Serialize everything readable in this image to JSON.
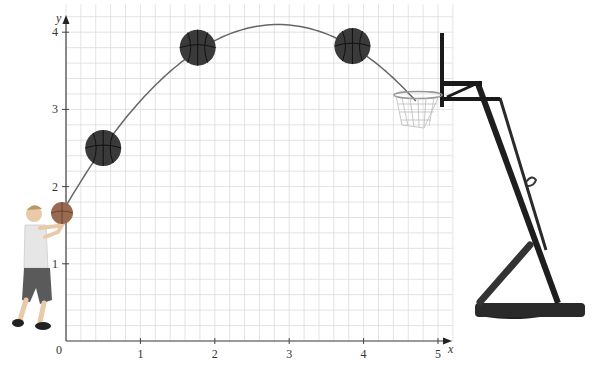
{
  "figure": {
    "axes": {
      "x_label": "x",
      "y_label": "y",
      "origin_label": "0",
      "x_ticks": [
        "1",
        "2",
        "3",
        "4",
        "5"
      ],
      "y_ticks": [
        "1",
        "2",
        "3",
        "4"
      ],
      "x_range": [
        0,
        5.2
      ],
      "y_range": [
        0,
        4.2
      ],
      "grid_step": 0.2
    },
    "trajectory": {
      "start": [
        0,
        1.75
      ],
      "vertex": [
        2.85,
        4.1
      ],
      "end": [
        4.7,
        3.05
      ]
    },
    "balls": [
      {
        "x": 0.5,
        "y": 2.5
      },
      {
        "x": 1.77,
        "y": 3.8
      },
      {
        "x": 3.85,
        "y": 3.82
      }
    ],
    "objects": [
      "child-shooter",
      "basketball-hoop"
    ],
    "colors": {
      "grid": "#dcdcdc",
      "axis": "#444444",
      "curve": "#666666",
      "ball": "#3a3a3a",
      "hoop": "#1a1a1a"
    }
  }
}
